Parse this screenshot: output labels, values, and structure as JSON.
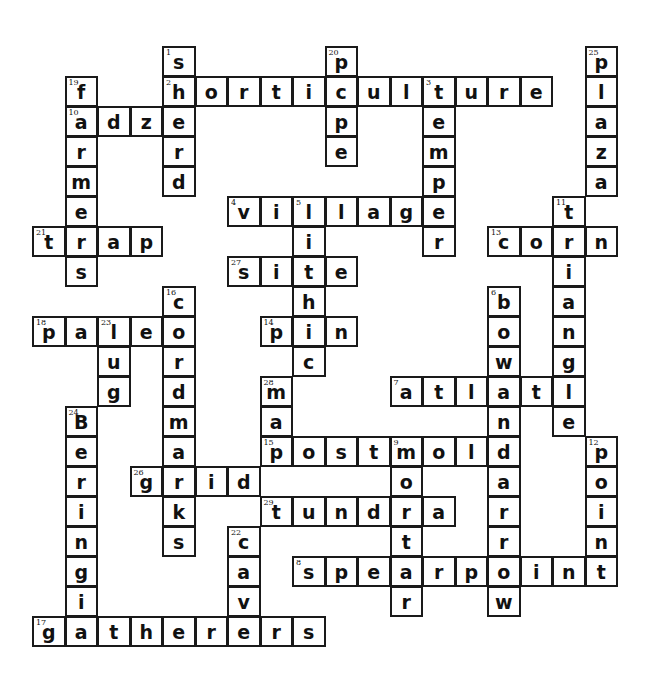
{
  "puzzle": {
    "type": "crossword",
    "grid": {
      "origin_x": 32,
      "origin_y": 46,
      "cell_w": 32.5,
      "cell_h": 30
    },
    "words": [
      {
        "num": "1",
        "dir": "down",
        "answer": "sherd",
        "row": 0,
        "col": 4
      },
      {
        "num": "2",
        "dir": "across",
        "answer": "horticulture",
        "row": 1,
        "col": 4
      },
      {
        "num": "3",
        "dir": "down",
        "answer": "temper",
        "row": 1,
        "col": 12
      },
      {
        "num": "4",
        "dir": "across",
        "answer": "village",
        "row": 5,
        "col": 6
      },
      {
        "num": "5",
        "dir": "down",
        "answer": "lithic",
        "row": 5,
        "col": 8
      },
      {
        "num": "6",
        "dir": "down",
        "answer": "bowandarrow",
        "row": 8,
        "col": 14
      },
      {
        "num": "7",
        "dir": "across",
        "answer": "atlatl",
        "row": 11,
        "col": 11
      },
      {
        "num": "8",
        "dir": "across",
        "answer": "spearpoint",
        "row": 17,
        "col": 8
      },
      {
        "num": "9",
        "dir": "down",
        "answer": "mortar",
        "row": 13,
        "col": 11
      },
      {
        "num": "10",
        "dir": "across",
        "answer": "adze",
        "row": 2,
        "col": 1
      },
      {
        "num": "11",
        "dir": "down",
        "answer": "triangle",
        "row": 5,
        "col": 16
      },
      {
        "num": "12",
        "dir": "down",
        "answer": "point",
        "row": 13,
        "col": 17
      },
      {
        "num": "13",
        "dir": "across",
        "answer": "corn",
        "row": 6,
        "col": 14
      },
      {
        "num": "14",
        "dir": "across",
        "answer": "pin",
        "row": 9,
        "col": 7
      },
      {
        "num": "15",
        "dir": "across",
        "answer": "postmold",
        "row": 13,
        "col": 7
      },
      {
        "num": "16",
        "dir": "down",
        "answer": "cordmarks",
        "row": 8,
        "col": 4
      },
      {
        "num": "17",
        "dir": "across",
        "answer": "gatherers",
        "row": 19,
        "col": 0
      },
      {
        "num": "18",
        "dir": "across",
        "answer": "paleo",
        "row": 9,
        "col": 0
      },
      {
        "num": "19",
        "dir": "down",
        "answer": "farmers",
        "row": 1,
        "col": 1
      },
      {
        "num": "20",
        "dir": "down",
        "answer": "pipe",
        "row": 0,
        "col": 9
      },
      {
        "num": "21",
        "dir": "across",
        "answer": "trap",
        "row": 6,
        "col": 0
      },
      {
        "num": "22",
        "dir": "down",
        "answer": "cave",
        "row": 16,
        "col": 6
      },
      {
        "num": "23",
        "dir": "down",
        "answer": "lug",
        "row": 9,
        "col": 2
      },
      {
        "num": "24",
        "dir": "down",
        "answer": "Beringia",
        "row": 12,
        "col": 1
      },
      {
        "num": "25",
        "dir": "down",
        "answer": "plaza",
        "row": 0,
        "col": 17
      },
      {
        "num": "26",
        "dir": "across",
        "answer": "grid",
        "row": 14,
        "col": 3
      },
      {
        "num": "27",
        "dir": "across",
        "answer": "site",
        "row": 7,
        "col": 6
      },
      {
        "num": "28",
        "dir": "down",
        "answer": "map",
        "row": 11,
        "col": 7
      },
      {
        "num": "29",
        "dir": "across",
        "answer": "tundra",
        "row": 15,
        "col": 7
      }
    ]
  }
}
